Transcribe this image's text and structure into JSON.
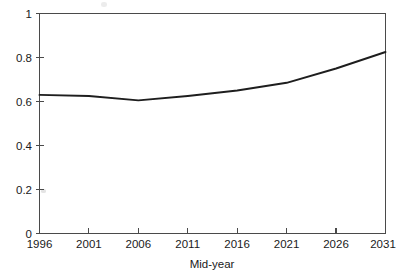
{
  "chart_data": {
    "type": "line",
    "title": "",
    "xlabel": "Mid-year",
    "ylabel": "",
    "x": [
      1996,
      2001,
      2006,
      2011,
      2016,
      2021,
      2026,
      2031
    ],
    "categories": [
      "1996",
      "2001",
      "2006",
      "2011",
      "2016",
      "2021",
      "2026",
      "2031"
    ],
    "values": [
      0.63,
      0.625,
      0.605,
      0.625,
      0.65,
      0.685,
      0.75,
      0.825
    ],
    "series": [
      {
        "name": "",
        "values": [
          0.63,
          0.625,
          0.605,
          0.625,
          0.65,
          0.685,
          0.75,
          0.825
        ]
      }
    ],
    "xlim": [
      1996,
      2031
    ],
    "ylim": [
      0,
      1
    ],
    "ytick_labels": [
      "0",
      "0.2",
      "0.4",
      "0.6",
      "0.8",
      "1"
    ],
    "ytick_values": [
      0,
      0.2,
      0.4,
      0.6,
      0.8,
      1
    ],
    "xtick_labels": [
      "1996",
      "2001",
      "2006",
      "2011",
      "2016",
      "2021",
      "2026",
      "2031"
    ],
    "grid": false,
    "legend": false,
    "line_color": "#1e1e1e",
    "axis_color": "#4a4a4a",
    "background": "#ffffff"
  }
}
